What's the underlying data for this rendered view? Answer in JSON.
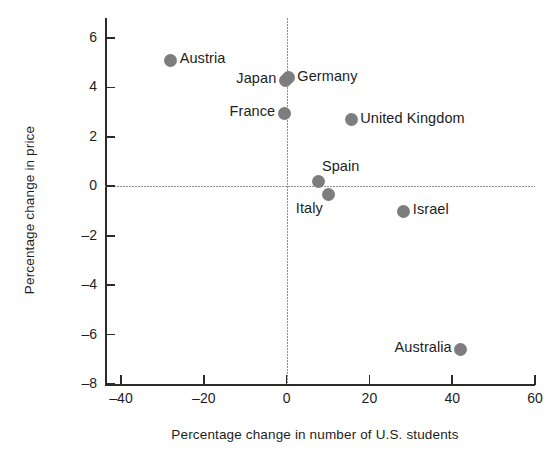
{
  "chart_data": {
    "type": "scatter",
    "title": "",
    "xlabel": "Percentage change in number of U.S. students",
    "ylabel": "Percentage change in price",
    "xlim": [
      -40,
      60
    ],
    "ylim": [
      -8,
      6
    ],
    "xticks": [
      -40,
      -20,
      0,
      20,
      40,
      60
    ],
    "xticklabels": [
      "–40",
      "–20",
      "0",
      "20",
      "40",
      "60"
    ],
    "yticks": [
      -8,
      -6,
      -4,
      -2,
      0,
      2,
      4,
      6
    ],
    "yticklabels": [
      "–8",
      "–6",
      "–4",
      "–2",
      "0",
      "2",
      "4",
      "6"
    ],
    "grid": false,
    "legend": "none",
    "reference_lines": [
      {
        "axis": "y",
        "value": 0,
        "style": "dotted",
        "color": "#8e8e8e"
      },
      {
        "axis": "x",
        "value": 0,
        "style": "dotted",
        "color": "#8e8e8e"
      }
    ],
    "marker_color": "#7d7d7d",
    "points": [
      {
        "label": "Austria",
        "x": -28.0,
        "y": 5.1,
        "label_side": "right"
      },
      {
        "label": "Germany",
        "x": 0.4,
        "y": 4.4,
        "label_side": "right"
      },
      {
        "label": "Japan",
        "x": -0.3,
        "y": 4.3,
        "label_side": "left"
      },
      {
        "label": "France",
        "x": -0.5,
        "y": 2.95,
        "label_side": "left"
      },
      {
        "label": "United Kingdom",
        "x": 15.6,
        "y": 2.7,
        "label_side": "right"
      },
      {
        "label": "Spain",
        "x": 7.8,
        "y": 0.2,
        "label_side": "above-right"
      },
      {
        "label": "Italy",
        "x": 10.2,
        "y": -0.35,
        "label_side": "below-left"
      },
      {
        "label": "Israel",
        "x": 28.3,
        "y": -1.0,
        "label_side": "right"
      },
      {
        "label": "Australia",
        "x": 42.0,
        "y": -6.6,
        "label_side": "left"
      }
    ]
  }
}
